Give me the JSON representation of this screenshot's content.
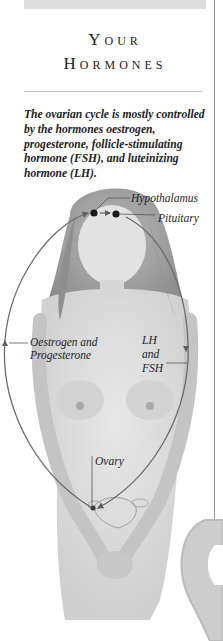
{
  "page": {
    "title_line1": "Your",
    "title_line2": "Hormones",
    "intro": "The ovarian cycle is mostly controlled by the hormones oestrogen, progesterone, follicle-stimulating hormone (FSH), and luteinizing hormone (LH)."
  },
  "figure": {
    "labels": {
      "hypothalamus": "Hypothalamus",
      "pituitary": "Pituitary",
      "oestrogen": "Oestrogen and Progesterone",
      "oestrogen_line1": "Oestrogen and",
      "oestrogen_line2": "Progesterone",
      "lh_line1": "LH",
      "lh_line2": "and",
      "lh_line3": "FSH",
      "ovary": "Ovary"
    },
    "colors": {
      "cycle_line": "#6a6a6a",
      "gland_dot": "#1a1a1a",
      "skin": "#d9d9d9",
      "hair": "#9c9c9c"
    }
  }
}
